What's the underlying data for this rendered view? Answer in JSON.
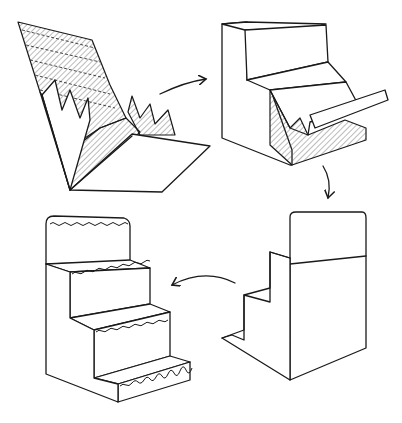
{
  "figure": {
    "colors": {
      "ink": "#1a1a1a",
      "background": "#ffffff",
      "hatch": "#555555"
    },
    "steps": [
      {
        "index": 1,
        "name": "flat-scored-sheet",
        "position": "top-left"
      },
      {
        "index": 2,
        "name": "partially-folded-steps",
        "position": "top-right"
      },
      {
        "index": 3,
        "name": "folded-box-back-view",
        "position": "bottom-right"
      },
      {
        "index": 4,
        "name": "finished-stepped-stand",
        "position": "bottom-left"
      }
    ],
    "arrows": [
      {
        "from": 1,
        "to": 2,
        "icon": "arrow-right-icon"
      },
      {
        "from": 2,
        "to": 3,
        "icon": "arrow-down-icon"
      },
      {
        "from": 3,
        "to": 4,
        "icon": "arrow-left-icon"
      }
    ]
  }
}
